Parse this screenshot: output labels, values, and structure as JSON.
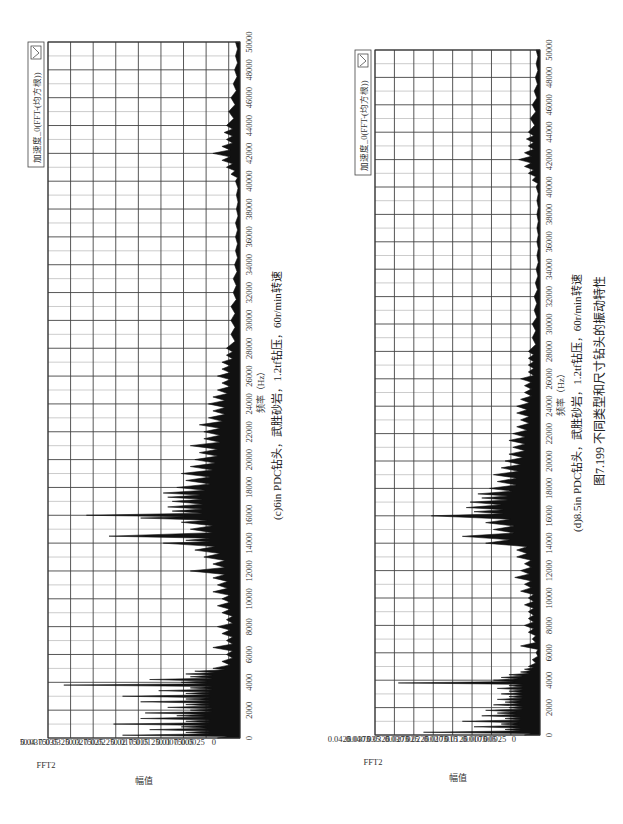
{
  "figure": {
    "caption": "图7.199  不同类型和尺寸钻头的振动特性"
  },
  "chart_data": [
    {
      "type": "area",
      "title": "",
      "subtitle": "(c)6in PDC钻头，武胜砂岩，1.2tf钻压，60r/min转速",
      "xlabel": "频率（Hz）",
      "ylabel": "幅值",
      "y_unit_label": "FFT2",
      "legend": [
        "加速度_0(FFT-(均方根))"
      ],
      "legend_position": "top-right",
      "grid": true,
      "xlim": [
        0,
        50000
      ],
      "ylim": [
        0,
        0.0425
      ],
      "x_ticks": [
        0,
        2000,
        4000,
        6000,
        8000,
        10000,
        12000,
        14000,
        16000,
        18000,
        20000,
        22000,
        24000,
        26000,
        28000,
        30000,
        32000,
        34000,
        36000,
        38000,
        40000,
        42000,
        44000,
        46000,
        48000,
        50000
      ],
      "y_ticks": [
        "0",
        "0.0025",
        "0.005",
        "0.0075",
        "0.01",
        "0.0125",
        "0.015",
        "0.0175",
        "0.02",
        "0.0225",
        "0.025",
        "0.0275",
        "0.03",
        "0.0325",
        "0.035",
        "0.0375",
        "0.04",
        "0.0425"
      ],
      "series": [
        {
          "name": "加速度_0(FFT-(均方根))",
          "x": [
            0,
            200,
            400,
            600,
            800,
            1000,
            1200,
            1400,
            1600,
            1800,
            2000,
            2200,
            2400,
            2600,
            2800,
            3000,
            3200,
            3400,
            3600,
            3800,
            4000,
            4200,
            4400,
            4600,
            4800,
            5000,
            5500,
            6000,
            6500,
            7000,
            7500,
            8000,
            8500,
            9000,
            9500,
            10000,
            10500,
            11000,
            11500,
            12000,
            12500,
            13000,
            13500,
            14000,
            14200,
            14500,
            15000,
            15500,
            15800,
            16000,
            16300,
            16600,
            17000,
            17300,
            17600,
            18000,
            18500,
            19000,
            19500,
            20000,
            20500,
            21000,
            21500,
            22000,
            22500,
            23000,
            23500,
            24000,
            24500,
            25000,
            25500,
            26000,
            26500,
            27000,
            27500,
            28000,
            29000,
            30000,
            31000,
            32000,
            33000,
            34000,
            35000,
            36000,
            37000,
            38000,
            39000,
            40000,
            40500,
            41000,
            41500,
            42000,
            42500,
            43000,
            43500,
            44000,
            45000,
            46000,
            47000,
            48000,
            49000,
            50000
          ],
          "values": [
            0.005,
            0.026,
            0.012,
            0.02,
            0.013,
            0.028,
            0.012,
            0.022,
            0.014,
            0.021,
            0.011,
            0.016,
            0.012,
            0.022,
            0.012,
            0.026,
            0.012,
            0.018,
            0.011,
            0.039,
            0.013,
            0.02,
            0.011,
            0.012,
            0.01,
            0.006,
            0.004,
            0.003,
            0.006,
            0.003,
            0.004,
            0.005,
            0.003,
            0.004,
            0.005,
            0.004,
            0.006,
            0.005,
            0.006,
            0.011,
            0.006,
            0.008,
            0.01,
            0.017,
            0.012,
            0.029,
            0.011,
            0.013,
            0.022,
            0.034,
            0.015,
            0.016,
            0.015,
            0.016,
            0.017,
            0.014,
            0.012,
            0.013,
            0.011,
            0.01,
            0.009,
            0.011,
            0.008,
            0.008,
            0.009,
            0.007,
            0.006,
            0.007,
            0.006,
            0.005,
            0.004,
            0.005,
            0.004,
            0.004,
            0.003,
            0.003,
            0.002,
            0.002,
            0.002,
            0.0015,
            0.0015,
            0.0012,
            0.001,
            0.001,
            0.001,
            0.0008,
            0.0008,
            0.001,
            0.002,
            0.003,
            0.004,
            0.006,
            0.004,
            0.003,
            0.0035,
            0.003,
            0.0025,
            0.002,
            0.0015,
            0.0012,
            0.001,
            0.001
          ]
        }
      ]
    },
    {
      "type": "area",
      "title": "",
      "subtitle": "(d)8.5in PDC钻头，武胜砂岩，1.2tf钻压，60r/min转速",
      "xlabel": "频率（Hz）",
      "ylabel": "幅值",
      "y_unit_label": "FFT2",
      "legend": [
        "加速度_0(FFT-(均方根))"
      ],
      "legend_position": "top-right",
      "grid": true,
      "xlim": [
        0,
        50000
      ],
      "ylim": [
        0,
        0.0425
      ],
      "x_ticks": [
        0,
        2000,
        4000,
        6000,
        8000,
        10000,
        12000,
        14000,
        16000,
        18000,
        20000,
        22000,
        24000,
        26000,
        28000,
        30000,
        32000,
        34000,
        36000,
        38000,
        40000,
        42000,
        44000,
        46000,
        48000,
        50000
      ],
      "y_ticks": [
        "0",
        "0.0025",
        "0.005",
        "0.0075",
        "0.01",
        "0.0125",
        "0.015",
        "0.0175",
        "0.02",
        "0.0225",
        "0.025",
        "0.0275",
        "0.03",
        "0.0325",
        "0.035",
        "0.0375",
        "0.04",
        "0.0425"
      ],
      "series": [
        {
          "name": "加速度_0(FFT-(均方根))",
          "x": [
            0,
            200,
            400,
            600,
            800,
            1000,
            1200,
            1400,
            1600,
            1800,
            2000,
            2200,
            2400,
            2600,
            2800,
            3000,
            3200,
            3400,
            3600,
            3800,
            4000,
            4200,
            4400,
            4600,
            4800,
            5000,
            5500,
            6000,
            6500,
            7000,
            7500,
            8000,
            8500,
            9000,
            9500,
            10000,
            10500,
            11000,
            11500,
            12000,
            12500,
            13000,
            13500,
            14000,
            14500,
            15000,
            15500,
            16000,
            16300,
            16600,
            17000,
            17300,
            17600,
            18000,
            18500,
            19000,
            19500,
            20000,
            20500,
            21000,
            21500,
            22000,
            22500,
            23000,
            23500,
            24000,
            24500,
            25000,
            25500,
            26000,
            26500,
            27000,
            27500,
            28000,
            29000,
            30000,
            31000,
            32000,
            33000,
            34000,
            35000,
            36000,
            37000,
            38000,
            39000,
            40000,
            40500,
            41000,
            41500,
            42000,
            42500,
            43000,
            43500,
            44000,
            45000,
            46000,
            47000,
            48000,
            49000,
            50000
          ],
          "values": [
            0.004,
            0.03,
            0.009,
            0.017,
            0.01,
            0.02,
            0.009,
            0.015,
            0.011,
            0.014,
            0.008,
            0.012,
            0.009,
            0.011,
            0.008,
            0.01,
            0.008,
            0.011,
            0.008,
            0.0365,
            0.012,
            0.01,
            0.008,
            0.005,
            0.004,
            0.003,
            0.002,
            0.001,
            0.005,
            0.002,
            0.003,
            0.004,
            0.003,
            0.003,
            0.004,
            0.003,
            0.005,
            0.004,
            0.0065,
            0.005,
            0.004,
            0.006,
            0.006,
            0.014,
            0.02,
            0.012,
            0.014,
            0.028,
            0.017,
            0.019,
            0.018,
            0.015,
            0.016,
            0.013,
            0.011,
            0.012,
            0.01,
            0.009,
            0.008,
            0.007,
            0.008,
            0.007,
            0.006,
            0.005,
            0.006,
            0.006,
            0.005,
            0.004,
            0.004,
            0.005,
            0.003,
            0.003,
            0.003,
            0.003,
            0.002,
            0.002,
            0.0015,
            0.0015,
            0.0012,
            0.001,
            0.0008,
            0.0008,
            0.0008,
            0.0008,
            0.0008,
            0.001,
            0.002,
            0.003,
            0.004,
            0.0055,
            0.004,
            0.003,
            0.0035,
            0.003,
            0.0025,
            0.002,
            0.0015,
            0.0012,
            0.001,
            0.001
          ]
        }
      ]
    }
  ]
}
